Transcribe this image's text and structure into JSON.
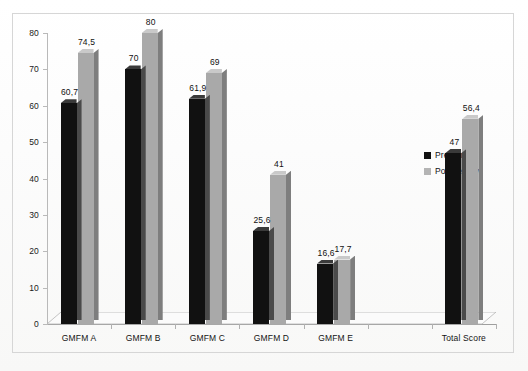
{
  "chart_data": {
    "type": "bar",
    "title": "",
    "subtitle": "",
    "xlabel": "",
    "ylabel": "",
    "ylim": [
      0,
      80
    ],
    "yticks": [
      "0",
      "10",
      "20",
      "30",
      "40",
      "50",
      "60",
      "70",
      "80"
    ],
    "grid": false,
    "legend_position": "right",
    "style": "3d-clustered-column",
    "decimal_separator": ",",
    "categories": [
      "GMFM A",
      "GMFM B",
      "GMFM C",
      "GMFM D",
      "GMFM E",
      "",
      "Total Score"
    ],
    "series": [
      {
        "name": "Pretherapy",
        "color": "#111111",
        "values": [
          60.7,
          70,
          61.9,
          25.6,
          16.6,
          null,
          47
        ],
        "labels": [
          "60,7",
          "70",
          "61,9",
          "25,6",
          "16,6",
          "",
          "47"
        ]
      },
      {
        "name": "Postherapy",
        "color": "#a9a9a9",
        "values": [
          74.5,
          80,
          69,
          41,
          17.7,
          null,
          56.4
        ],
        "labels": [
          "74,5",
          "80",
          "69",
          "41",
          "17,7",
          "",
          "56,4"
        ]
      }
    ]
  },
  "legend": {
    "items": [
      {
        "label": "Pretherapy",
        "color": "#111111"
      },
      {
        "label": "Postherapy",
        "color": "#b4b4b4"
      }
    ]
  }
}
